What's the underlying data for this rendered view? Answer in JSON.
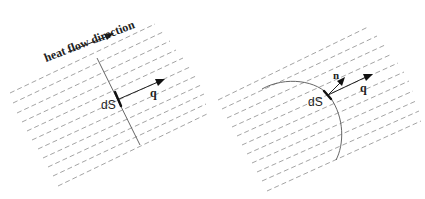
{
  "figure": {
    "left_panel": {
      "heat_flow_label": "heat flow direction",
      "surface_element_label": "dS",
      "flux_label": "q",
      "description": "flat surface element dS crossed by heat flux q"
    },
    "right_panel": {
      "surface_element_label": "dS",
      "normal_label": "n",
      "flux_label": "q",
      "description": "curved surface element dS with normal n and heat flux q"
    },
    "colors": {
      "background": "#ffffff",
      "isotherm_lines": "#9a9a9a",
      "surface_line": "#555555",
      "arrows": "#111111"
    }
  }
}
